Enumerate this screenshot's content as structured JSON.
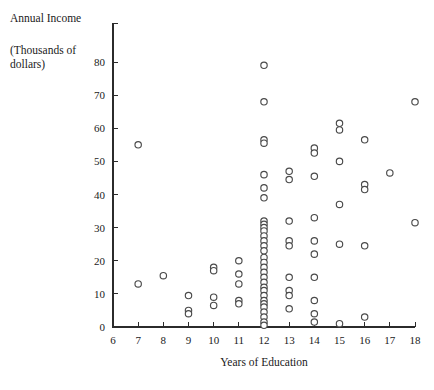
{
  "figure": {
    "width": 434,
    "height": 390,
    "background": "#ffffff",
    "ink_color": "#2b2b2b",
    "marker_stroke_color": "#4a4a4a",
    "marker_fill_color": "#ffffff"
  },
  "labels": {
    "corner_title_line1": "Annual Income",
    "corner_title_line2": "(Thousands of",
    "corner_title_line3": "dollars)",
    "xlabel": "Years of Education"
  },
  "chart_data": {
    "type": "scatter",
    "title": "",
    "xlabel": "Years of Education",
    "ylabel": "Annual Income (Thousands of dollars)",
    "xlim": [
      6,
      18
    ],
    "ylim": [
      0,
      84
    ],
    "xticks": [
      6,
      7,
      8,
      9,
      10,
      11,
      12,
      13,
      14,
      15,
      16,
      17,
      18
    ],
    "yticks": [
      0,
      10,
      20,
      30,
      40,
      50,
      60,
      70,
      80
    ],
    "xticklabels": [
      "6",
      "7",
      "8",
      "9",
      "10",
      "11",
      "12",
      "13",
      "14",
      "15",
      "16",
      "17",
      "18"
    ],
    "yticklabels": [
      "0",
      "10",
      "20",
      "30",
      "40",
      "50",
      "60",
      "70",
      "80"
    ],
    "grid": false,
    "legend": false,
    "marker": "open-circle",
    "marker_size": 3.2,
    "points": [
      {
        "x": 7,
        "y": 55
      },
      {
        "x": 7,
        "y": 13
      },
      {
        "x": 8,
        "y": 15.5
      },
      {
        "x": 9,
        "y": 9.5
      },
      {
        "x": 9,
        "y": 5
      },
      {
        "x": 9,
        "y": 4
      },
      {
        "x": 10,
        "y": 18
      },
      {
        "x": 10,
        "y": 17
      },
      {
        "x": 10,
        "y": 9
      },
      {
        "x": 10,
        "y": 6.5
      },
      {
        "x": 11,
        "y": 20
      },
      {
        "x": 11,
        "y": 16
      },
      {
        "x": 11,
        "y": 13
      },
      {
        "x": 11,
        "y": 8
      },
      {
        "x": 11,
        "y": 7
      },
      {
        "x": 12,
        "y": 79
      },
      {
        "x": 12,
        "y": 68
      },
      {
        "x": 12,
        "y": 56.5
      },
      {
        "x": 12,
        "y": 55.5
      },
      {
        "x": 12,
        "y": 46
      },
      {
        "x": 12,
        "y": 42
      },
      {
        "x": 12,
        "y": 39
      },
      {
        "x": 12,
        "y": 32
      },
      {
        "x": 12,
        "y": 31
      },
      {
        "x": 12,
        "y": 30
      },
      {
        "x": 12,
        "y": 29
      },
      {
        "x": 12,
        "y": 27.5
      },
      {
        "x": 12,
        "y": 26
      },
      {
        "x": 12,
        "y": 24.5
      },
      {
        "x": 12,
        "y": 23
      },
      {
        "x": 12,
        "y": 21
      },
      {
        "x": 12,
        "y": 19.5
      },
      {
        "x": 12,
        "y": 18
      },
      {
        "x": 12,
        "y": 16.5
      },
      {
        "x": 12,
        "y": 15
      },
      {
        "x": 12,
        "y": 13.5
      },
      {
        "x": 12,
        "y": 12
      },
      {
        "x": 12,
        "y": 11
      },
      {
        "x": 12,
        "y": 9.5
      },
      {
        "x": 12,
        "y": 8
      },
      {
        "x": 12,
        "y": 7
      },
      {
        "x": 12,
        "y": 6
      },
      {
        "x": 12,
        "y": 4.5
      },
      {
        "x": 12,
        "y": 3
      },
      {
        "x": 12,
        "y": 1.5
      },
      {
        "x": 12,
        "y": 0.5
      },
      {
        "x": 13,
        "y": 47
      },
      {
        "x": 13,
        "y": 44.5
      },
      {
        "x": 13,
        "y": 32
      },
      {
        "x": 13,
        "y": 26
      },
      {
        "x": 13,
        "y": 24.5
      },
      {
        "x": 13,
        "y": 15
      },
      {
        "x": 13,
        "y": 11
      },
      {
        "x": 13,
        "y": 9.5
      },
      {
        "x": 13,
        "y": 5.5
      },
      {
        "x": 14,
        "y": 54
      },
      {
        "x": 14,
        "y": 52.5
      },
      {
        "x": 14,
        "y": 45.5
      },
      {
        "x": 14,
        "y": 33
      },
      {
        "x": 14,
        "y": 26
      },
      {
        "x": 14,
        "y": 22
      },
      {
        "x": 14,
        "y": 15
      },
      {
        "x": 14,
        "y": 8
      },
      {
        "x": 14,
        "y": 4
      },
      {
        "x": 14,
        "y": 1.5
      },
      {
        "x": 15,
        "y": 61.5
      },
      {
        "x": 15,
        "y": 59.5
      },
      {
        "x": 15,
        "y": 50
      },
      {
        "x": 15,
        "y": 37
      },
      {
        "x": 15,
        "y": 25
      },
      {
        "x": 15,
        "y": 1
      },
      {
        "x": 16,
        "y": 56.5
      },
      {
        "x": 16,
        "y": 43
      },
      {
        "x": 16,
        "y": 41.5
      },
      {
        "x": 16,
        "y": 24.5
      },
      {
        "x": 16,
        "y": 3
      },
      {
        "x": 17,
        "y": 46.5
      },
      {
        "x": 18,
        "y": 68
      },
      {
        "x": 18,
        "y": 31.5
      }
    ]
  }
}
